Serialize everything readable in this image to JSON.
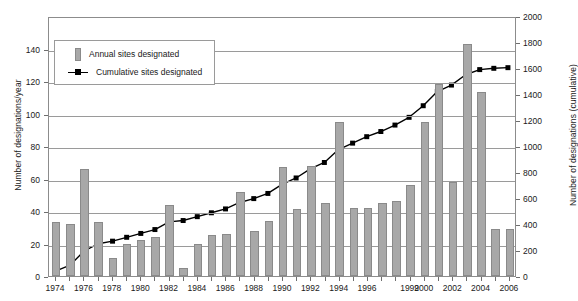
{
  "chart_data": {
    "type": "bar",
    "title": "",
    "subtitle": "",
    "xlabel": "",
    "ylabel": "Number of designations/year",
    "ylabel_right": "Number of designations (cumulative)",
    "ylim": [
      0,
      160
    ],
    "ylim_right": [
      0,
      2000
    ],
    "yticks": [
      0,
      20,
      40,
      60,
      80,
      100,
      120,
      140
    ],
    "yticks_right": [
      0,
      200,
      400,
      600,
      800,
      1000,
      1200,
      1400,
      1600,
      1800,
      2000
    ],
    "grid": true,
    "legend_position": "top-left",
    "categories": [
      "1974",
      "1975",
      "1976",
      "1977",
      "1978",
      "1979",
      "1980",
      "1981",
      "1982",
      "1983",
      "1984",
      "1985",
      "1986",
      "1987",
      "1988",
      "1989",
      "1990",
      "1991",
      "1992",
      "1993",
      "1994",
      "1995",
      "1996",
      "1997",
      "1998",
      "1999",
      "2000",
      "2001",
      "2002",
      "2003",
      "2004",
      "2005",
      "2006"
    ],
    "xtick_labels": [
      "1974",
      "1976",
      "1978",
      "1980",
      "1982",
      "1984",
      "1986",
      "1988",
      "1990",
      "1992",
      "1994",
      "1996",
      "1999",
      "2000",
      "2002",
      "2004",
      "2006"
    ],
    "series": [
      {
        "name": "Annual sites designated",
        "type": "bar",
        "axis": "left",
        "color": "#a8a8a8",
        "values": [
          33,
          32,
          66,
          33,
          11,
          20,
          22,
          24,
          44,
          5,
          20,
          25,
          26,
          52,
          28,
          34,
          67,
          41,
          68,
          45,
          95,
          42,
          42,
          45,
          46,
          56,
          95,
          118,
          58,
          143,
          113,
          29,
          29
        ]
      },
      {
        "name": "Cumulative sites designated",
        "type": "line",
        "axis": "right",
        "color": "#000000",
        "marker": "square",
        "values": [
          40,
          85,
          195,
          250,
          270,
          300,
          330,
          360,
          420,
          430,
          460,
          490,
          520,
          570,
          600,
          640,
          710,
          760,
          830,
          880,
          980,
          1030,
          1080,
          1120,
          1170,
          1230,
          1320,
          1430,
          1480,
          1560,
          1600,
          1610,
          1615
        ]
      }
    ]
  },
  "legend": {
    "items": [
      {
        "label": "Annual sites designated",
        "marker": "bar-swatch"
      },
      {
        "label": "Cumulative sites designated",
        "marker": "line-marker-swatch"
      }
    ]
  }
}
